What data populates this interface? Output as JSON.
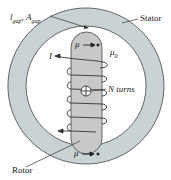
{
  "labels": {
    "gap": "l",
    "gap_sub1": "gap",
    "gap_sep": ", ",
    "gap_area": "A",
    "gap_sub2": "gap",
    "stator": "Stator",
    "rotor": "Rotor",
    "current": "I",
    "turns": "N turns",
    "mu_rotor": "μ",
    "mu0": "μ",
    "mu0_sub": "0",
    "mu_stator": "μ"
  },
  "colors": {
    "stator_fill": "#c9d3d6",
    "rotor_fill": "#c8c8c8",
    "line": "#333333"
  }
}
